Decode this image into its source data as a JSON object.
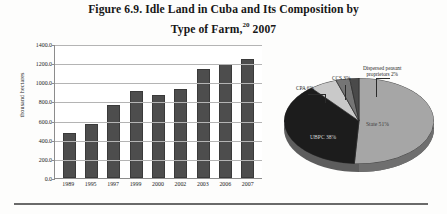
{
  "figure": {
    "title_line1": "Figure 6.9. Idle Land in Cuba and Its Composition by",
    "title_line2_before": "Type of Farm,",
    "title_footnote_marker": "20",
    "title_line2_after": " 2007"
  },
  "chart_data": [
    {
      "type": "bar",
      "title": "Idle Land in Cuba",
      "xlabel": "",
      "ylabel": "thousand hectares",
      "categories": [
        "1989",
        "1995",
        "1997",
        "1999",
        "2000",
        "2002",
        "2003",
        "2006",
        "2007"
      ],
      "values": [
        470,
        560,
        760,
        905,
        870,
        935,
        1140,
        1190,
        1245
      ],
      "ylim": [
        0,
        1400
      ],
      "ytick_labels": [
        "0.0",
        "200.0",
        "400.0",
        "600.0",
        "800.0",
        "1000.0",
        "1200.0",
        "1400.0"
      ],
      "ytick_values": [
        0,
        200,
        400,
        600,
        800,
        1000,
        1200,
        1400
      ],
      "grid": true,
      "legend": "none",
      "series_color": "#4d4d4d"
    },
    {
      "type": "pie",
      "title": "Composition by Type of Farm, 2007",
      "labels": [
        "State",
        "UBPC",
        "CPA",
        "CCS",
        "Dispersed peasant proprietors"
      ],
      "values": [
        51,
        38,
        6,
        3,
        2
      ],
      "value_suffix": "%",
      "data_labels": [
        "State 51%",
        "UBPC 38%",
        "CPA 6%",
        "CCS 3%",
        "Dispersed peasant proprietors 2%"
      ],
      "callout_disp_line1": "Dispersed peasant",
      "callout_disp_line2": "proprietors 2%",
      "slice_colors": [
        "#a6a6a6",
        "#1c1c1c",
        "#c9c9c9",
        "#757575",
        "#4a4a4a"
      ],
      "legend": "none",
      "three_d": true
    }
  ]
}
